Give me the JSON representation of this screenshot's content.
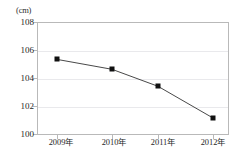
{
  "chart_data": {
    "type": "line",
    "title": "",
    "subtitle": "",
    "xlabel": "",
    "ylabel": "",
    "unit_label": "(cm)",
    "categories": [
      "2009年",
      "2010年",
      "2011年",
      "2012年"
    ],
    "values": [
      105.35,
      104.65,
      103.45,
      101.2
    ],
    "series": [
      {
        "name": "",
        "values": [
          105.35,
          104.65,
          103.45,
          101.2
        ],
        "marker": "square",
        "marker_color": "#111111",
        "line_color": "#333333"
      }
    ],
    "ylim": [
      100,
      108
    ],
    "yticks": [
      108,
      106,
      104,
      102,
      100
    ],
    "ytick_labels": [
      "108",
      "106",
      "104",
      "102",
      "100"
    ],
    "xtick_labels": [
      "2009年",
      "2010年",
      "2011年",
      "2012年"
    ],
    "grid": true,
    "grid_axis": "y",
    "grid_color": "#e9e9ec",
    "axis_color": "#b9b9b9",
    "legend": false,
    "legend_position": "none",
    "annotations": []
  },
  "axis": {
    "unit": "(cm)",
    "y_labels": [
      "108",
      "106",
      "104",
      "102",
      "100"
    ],
    "x_labels": [
      "2009年",
      "2010年",
      "2011年",
      "2012年"
    ]
  }
}
